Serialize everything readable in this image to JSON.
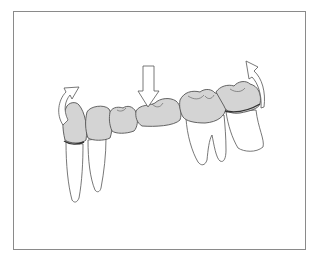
{
  "figure": {
    "caption": "",
    "colors": {
      "crown_fill": "#d4d4d4",
      "outline": "#555555",
      "root_fill": "#ffffff",
      "arrow_fill": "#ffffff",
      "frame": "#8a8a8a"
    },
    "elements": {
      "left_arrow": "curved-rotation-arrow (counter-clockwise tipping)",
      "center_arrow": "downward-force-arrow (vertical load on pontic)",
      "right_arrow": "curved-rotation-arrow (clockwise tipping)",
      "teeth": [
        "canine abutment",
        "premolar",
        "pontic",
        "pontic",
        "molar abutment",
        "molar abutment"
      ]
    }
  }
}
